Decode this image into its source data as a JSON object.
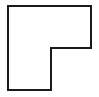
{
  "figure": {
    "title": "",
    "background_color": "#ffffff",
    "width": 99,
    "height": 97
  },
  "shape": {
    "name": "l-shaped-polygon",
    "description": "L-shape outline",
    "stroke_color": "#1a1a1a",
    "fill_color": "#ffffff",
    "stroke_width": 2,
    "points": "8,6 91,6 91,48 51,48 51,90 8,90",
    "vertices": [
      {
        "x": 8,
        "y": 6
      },
      {
        "x": 91,
        "y": 6
      },
      {
        "x": 91,
        "y": 48
      },
      {
        "x": 51,
        "y": 48
      },
      {
        "x": 51,
        "y": 90
      },
      {
        "x": 8,
        "y": 90
      }
    ]
  }
}
